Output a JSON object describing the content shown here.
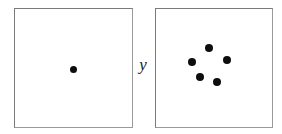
{
  "figure": {
    "type": "scatter-comparison",
    "background_color": "#ffffff",
    "width": 282,
    "height": 134,
    "border_color": "#7b7b7b",
    "dot_color": "#0d0d0d"
  },
  "label": {
    "y_axis": "y"
  },
  "panels": [
    {
      "name": "left-panel",
      "x": 14,
      "y": 8,
      "width": 119,
      "height": 120,
      "dot_count": 1,
      "dots": [
        {
          "name": "dot-center",
          "cx": 73.5,
          "cy": 69.5,
          "r": 3.9
        }
      ]
    },
    {
      "name": "right-panel",
      "x": 155,
      "y": 8,
      "width": 118,
      "height": 120,
      "dot_count": 5,
      "dots": [
        {
          "name": "dot-top",
          "cx": 209.0,
          "cy": 48.0,
          "r": 4.1
        },
        {
          "name": "dot-left",
          "cx": 192.0,
          "cy": 62.0,
          "r": 4.1
        },
        {
          "name": "dot-right",
          "cx": 227.0,
          "cy": 60.0,
          "r": 4.1
        },
        {
          "name": "dot-bottom-left",
          "cx": 200.0,
          "cy": 77.0,
          "r": 4.1
        },
        {
          "name": "dot-bottom-right",
          "cx": 217.0,
          "cy": 82.0,
          "r": 4.1
        }
      ]
    }
  ],
  "chart_data": {
    "type": "scatter",
    "title": "",
    "subtitle": "",
    "xlabel": "",
    "ylabel": "y",
    "grid": false,
    "legend": null,
    "annotations": [],
    "panel_layout": "1x2",
    "panels": [
      {
        "panel_label": "",
        "n_points": 1,
        "xlim": [
          0,
          1
        ],
        "ylim": [
          0,
          1
        ],
        "points": [
          {
            "x": 0.5,
            "y": 0.49
          }
        ]
      },
      {
        "panel_label": "",
        "n_points": 5,
        "xlim": [
          0,
          1
        ],
        "ylim": [
          0,
          1
        ],
        "points": [
          {
            "x": 0.46,
            "y": 0.67
          },
          {
            "x": 0.31,
            "y": 0.55
          },
          {
            "x": 0.61,
            "y": 0.57
          },
          {
            "x": 0.38,
            "y": 0.43
          },
          {
            "x": 0.53,
            "y": 0.38
          }
        ]
      }
    ]
  }
}
